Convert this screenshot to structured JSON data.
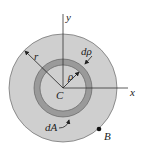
{
  "diagram": {
    "labels": {
      "y_axis": "y",
      "x_axis": "x",
      "radius": "r",
      "ring_thickness": "dρ",
      "ring_radius": "ρ",
      "centroid": "C",
      "area_element": "dA",
      "point": "B"
    },
    "colors": {
      "outer_disk": "#cfcfcf",
      "ring": "#9a9a9a",
      "inner_disk": "#cfcfcf",
      "lines": "#333333"
    }
  }
}
